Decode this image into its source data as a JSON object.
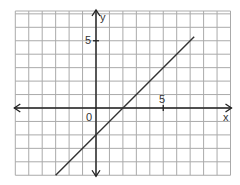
{
  "chart_data": {
    "type": "line",
    "title": "",
    "xlabel": "x",
    "ylabel": "y",
    "xlim": [
      -6,
      10
    ],
    "ylim": [
      -5,
      7
    ],
    "grid": true,
    "tick_labels": {
      "x": [
        "5"
      ],
      "y": [
        "5"
      ],
      "origin": "0"
    },
    "series": [
      {
        "name": "line",
        "equation": "y = x - 2",
        "x": [
          -3,
          7.3
        ],
        "y": [
          -5,
          5.3
        ]
      }
    ]
  },
  "labels": {
    "x_axis": "x",
    "y_axis": "y",
    "x_tick": "5",
    "y_tick": "5",
    "origin": "0"
  },
  "colors": {
    "grid": "#aaaaaa",
    "axis": "#222222",
    "line": "#333333"
  }
}
